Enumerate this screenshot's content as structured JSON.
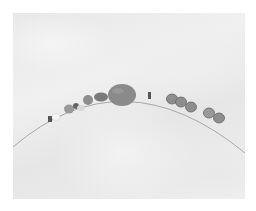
{
  "image": {
    "description": "Photo of a beaded necklace strand arcing across white crinkled fabric",
    "colors": {
      "background": "#ffffff",
      "fabric": "#ececec",
      "wire": "#a8a8a8",
      "center_bead": "#8a8a8a",
      "beads": "#9a9a9a"
    }
  }
}
